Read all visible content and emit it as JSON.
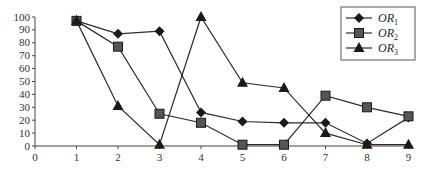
{
  "chart_data": {
    "type": "line",
    "title": "",
    "xlabel": "",
    "ylabel": "",
    "x": [
      1,
      2,
      3,
      4,
      5,
      6,
      7,
      8,
      9
    ],
    "xticks": [
      "0",
      "1",
      "2",
      "3",
      "4",
      "5",
      "6",
      "7",
      "8",
      "9"
    ],
    "yticks": [
      "0",
      "10",
      "20",
      "30",
      "40",
      "50",
      "60",
      "70",
      "80",
      "90",
      "100"
    ],
    "xlim": [
      0,
      9
    ],
    "ylim": [
      0,
      100
    ],
    "grid": false,
    "legend_position": "top-right",
    "series": [
      {
        "name": "OR1",
        "label_main": "OR",
        "label_sub": "1",
        "marker": "diamond",
        "values": [
          97,
          87,
          89,
          26,
          19,
          18,
          18,
          2,
          22
        ]
      },
      {
        "name": "OR2",
        "label_main": "OR",
        "label_sub": "2",
        "marker": "square",
        "values": [
          97,
          77,
          25,
          18,
          1,
          1,
          39,
          30,
          23
        ]
      },
      {
        "name": "OR3",
        "label_main": "OR",
        "label_sub": "3",
        "marker": "triangle",
        "values": [
          97,
          31,
          1,
          100,
          49,
          45,
          10,
          1,
          1
        ]
      }
    ],
    "colors": {
      "line": "#2b2b2b",
      "marker": "#1a1a1a",
      "axis": "#444444"
    }
  }
}
